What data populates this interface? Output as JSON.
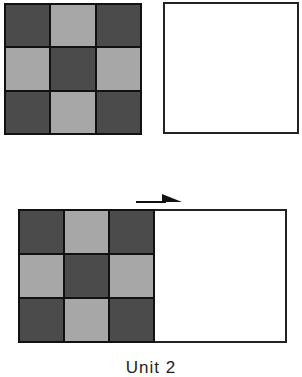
{
  "diagram": {
    "colors": {
      "dark": "#4b4b4b",
      "light": "#a7a7a7",
      "border": "#111111",
      "blank": "#ffffff"
    },
    "top_grid": {
      "rows": 3,
      "cols": 3,
      "pattern": [
        "dark",
        "light",
        "dark",
        "light",
        "dark",
        "light",
        "dark",
        "light",
        "dark"
      ]
    },
    "top_blank_square": true,
    "bottom_grid": {
      "rows": 3,
      "cols": 3,
      "pattern": [
        "dark",
        "light",
        "dark",
        "light",
        "dark",
        "light",
        "dark",
        "light",
        "dark"
      ]
    },
    "arrow": {
      "direction": "right"
    },
    "caption": "Unit 2"
  }
}
